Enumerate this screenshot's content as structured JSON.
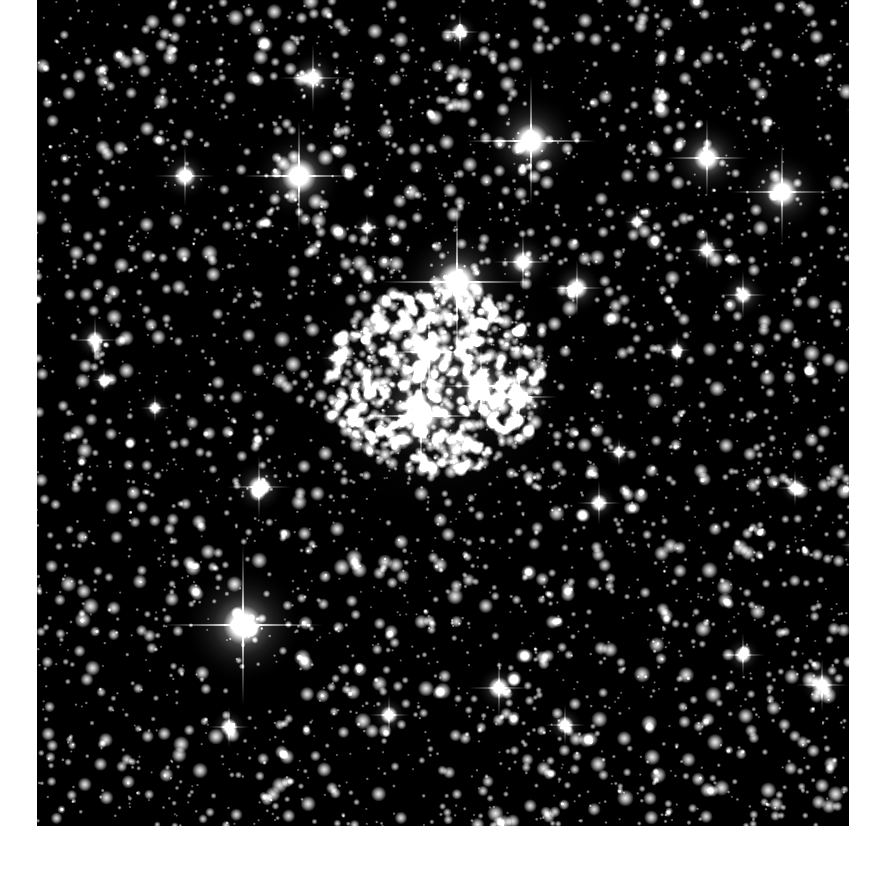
{
  "image": {
    "subject": "open star cluster field",
    "background_color": "#000000",
    "page_background": "#ffffff",
    "frame": {
      "x": 37,
      "y": 0,
      "width": 812,
      "height": 826
    }
  },
  "starfield": {
    "seed": 1337,
    "faint_star_count": 3400,
    "core": {
      "cx": 400,
      "cy": 380,
      "rx": 110,
      "ry": 95,
      "count": 650
    },
    "bright_stars": [
      {
        "x": 420,
        "y": 282,
        "r": 9,
        "glow": 55,
        "spike": 75
      },
      {
        "x": 206,
        "y": 625,
        "r": 9,
        "glow": 60,
        "spike": 80
      },
      {
        "x": 494,
        "y": 141,
        "r": 8,
        "glow": 48,
        "spike": 65
      },
      {
        "x": 262,
        "y": 176,
        "r": 8,
        "glow": 45,
        "spike": 55
      },
      {
        "x": 745,
        "y": 192,
        "r": 7,
        "glow": 40,
        "spike": 50
      },
      {
        "x": 670,
        "y": 158,
        "r": 6,
        "glow": 38,
        "spike": 40
      },
      {
        "x": 384,
        "y": 416,
        "r": 8,
        "glow": 45,
        "spike": 55
      },
      {
        "x": 392,
        "y": 352,
        "r": 6,
        "glow": 35,
        "spike": 40
      },
      {
        "x": 444,
        "y": 386,
        "r": 6,
        "glow": 35,
        "spike": 40
      },
      {
        "x": 482,
        "y": 397,
        "r": 6,
        "glow": 32,
        "spike": 38
      },
      {
        "x": 486,
        "y": 262,
        "r": 5,
        "glow": 28,
        "spike": 30
      },
      {
        "x": 276,
        "y": 78,
        "r": 5,
        "glow": 26,
        "spike": 34
      },
      {
        "x": 148,
        "y": 176,
        "r": 5,
        "glow": 24,
        "spike": 30
      },
      {
        "x": 222,
        "y": 487,
        "r": 5,
        "glow": 26,
        "spike": 32
      },
      {
        "x": 540,
        "y": 288,
        "r": 5,
        "glow": 26,
        "spike": 28
      },
      {
        "x": 706,
        "y": 295,
        "r": 4,
        "glow": 22,
        "spike": 24
      },
      {
        "x": 462,
        "y": 688,
        "r": 5,
        "glow": 22,
        "spike": 30
      },
      {
        "x": 785,
        "y": 685,
        "r": 5,
        "glow": 22,
        "spike": 26
      },
      {
        "x": 706,
        "y": 655,
        "r": 4,
        "glow": 18,
        "spike": 22
      },
      {
        "x": 58,
        "y": 340,
        "r": 4,
        "glow": 20,
        "spike": 24
      },
      {
        "x": 192,
        "y": 727,
        "r": 4,
        "glow": 18,
        "spike": 20
      },
      {
        "x": 352,
        "y": 715,
        "r": 4,
        "glow": 18,
        "spike": 20
      },
      {
        "x": 528,
        "y": 725,
        "r": 4,
        "glow": 18,
        "spike": 20
      },
      {
        "x": 562,
        "y": 503,
        "r": 4,
        "glow": 18,
        "spike": 22
      },
      {
        "x": 758,
        "y": 488,
        "r": 4,
        "glow": 16,
        "spike": 18
      },
      {
        "x": 670,
        "y": 250,
        "r": 4,
        "glow": 18,
        "spike": 20
      },
      {
        "x": 330,
        "y": 228,
        "r": 3,
        "glow": 14,
        "spike": 14
      },
      {
        "x": 423,
        "y": 32,
        "r": 4,
        "glow": 18,
        "spike": 20
      },
      {
        "x": 825,
        "y": 110,
        "r": 4,
        "glow": 18,
        "spike": 16
      },
      {
        "x": 118,
        "y": 408,
        "r": 3,
        "glow": 14,
        "spike": 14
      },
      {
        "x": 302,
        "y": 358,
        "r": 4,
        "glow": 18,
        "spike": 18
      },
      {
        "x": 582,
        "y": 452,
        "r": 3,
        "glow": 14,
        "spike": 14
      },
      {
        "x": 640,
        "y": 350,
        "r": 3,
        "glow": 14,
        "spike": 14
      },
      {
        "x": 818,
        "y": 545,
        "r": 3,
        "glow": 14,
        "spike": 14
      },
      {
        "x": 67,
        "y": 380,
        "r": 3,
        "glow": 14,
        "spike": 12
      },
      {
        "x": 600,
        "y": 222,
        "r": 3,
        "glow": 14,
        "spike": 12
      }
    ]
  }
}
